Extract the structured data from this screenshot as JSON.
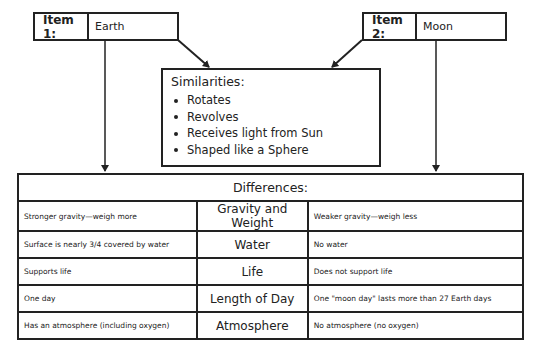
{
  "item1": {
    "label": "Item 1:",
    "value": "Earth"
  },
  "item2": {
    "label": "Item 2:",
    "value": "Moon"
  },
  "similarities": {
    "title": "Similarities:",
    "items": [
      "Rotates",
      "Revolves",
      "Receives light from Sun",
      "Shaped like a Sphere"
    ]
  },
  "differences": {
    "title": "Differences:",
    "rows": [
      {
        "item1": "Stronger gravity—weigh more",
        "category": "Gravity and Weight",
        "item2": "Weaker gravity—weigh less"
      },
      {
        "item1": "Surface is nearly 3/4 covered by water",
        "category": "Water",
        "item2": "No water"
      },
      {
        "item1": "Supports life",
        "category": "Life",
        "item2": "Does not support life"
      },
      {
        "item1": "One day",
        "category": "Length of Day",
        "item2": "One \"moon day\" lasts more than 27 Earth days"
      },
      {
        "item1": "Has an atmosphere (including oxygen)",
        "category": "Atmosphere",
        "item2": "No atmosphere (no oxygen)"
      }
    ]
  },
  "colors": {
    "line": "#222222",
    "background": "#ffffff"
  }
}
